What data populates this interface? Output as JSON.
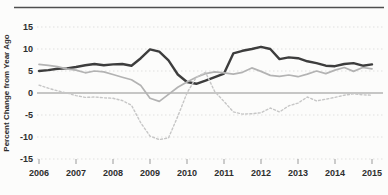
{
  "chart_data": {
    "type": "line",
    "title": "",
    "xlabel": "",
    "ylabel": "Percent Change from Year Ago",
    "x_start": 2006,
    "x_step": 0.25,
    "xlim": [
      2006,
      2015
    ],
    "ylim": [
      -15,
      15
    ],
    "grid": true,
    "legend_position": "none",
    "y_ticks": [
      15,
      10,
      5,
      0,
      -5,
      -10,
      -15
    ],
    "x_ticks": [
      2006,
      2007,
      2008,
      2009,
      2010,
      2011,
      2012,
      2013,
      2014,
      2015
    ],
    "zero_line": true,
    "series": [
      {
        "name": "dark-solid-line",
        "style": "solid",
        "color": "#3d3d3d",
        "width": 2.4,
        "values": [
          5.0,
          5.2,
          5.5,
          5.6,
          5.9,
          6.3,
          6.6,
          6.3,
          6.5,
          6.6,
          6.2,
          7.9,
          9.9,
          9.4,
          7.4,
          4.2,
          2.5,
          2.1,
          2.8,
          3.6,
          4.4,
          9.0,
          9.6,
          10.0,
          10.5,
          10.0,
          7.7,
          8.1,
          7.9,
          7.2,
          6.8,
          6.2,
          6.1,
          6.6,
          6.8,
          6.2,
          6.5
        ]
      },
      {
        "name": "gray-solid-line",
        "style": "solid",
        "color": "#b3b3b3",
        "width": 1.7,
        "values": [
          6.5,
          6.3,
          6.0,
          5.5,
          5.2,
          4.6,
          5.0,
          4.8,
          4.2,
          3.6,
          3.0,
          1.7,
          -1.2,
          -1.9,
          -0.3,
          1.3,
          2.5,
          3.6,
          4.4,
          4.8,
          4.6,
          4.3,
          4.7,
          5.7,
          4.9,
          4.0,
          3.8,
          4.1,
          3.7,
          4.3,
          5.0,
          4.4,
          5.2,
          5.8,
          4.9,
          5.8,
          5.5
        ]
      },
      {
        "name": "light-dotted-line",
        "style": "dotted",
        "color": "#c6c6c6",
        "width": 1.4,
        "values": [
          1.8,
          1.1,
          0.5,
          0.0,
          -0.6,
          -1.0,
          -0.9,
          -1.1,
          -1.2,
          -1.7,
          -2.8,
          -6.8,
          -9.8,
          -10.6,
          -10.2,
          -5.3,
          0.0,
          3.6,
          4.7,
          0.3,
          -1.9,
          -4.3,
          -4.8,
          -4.7,
          -4.5,
          -3.4,
          -4.3,
          -2.9,
          -2.3,
          -0.9,
          -1.8,
          -1.4,
          -1.0,
          -0.5,
          -0.2,
          -0.4,
          -0.5
        ]
      }
    ]
  },
  "colors": {
    "background": "#fcfcfb",
    "top_rule": "#4f4f4f",
    "gridline": "#e0e0df",
    "zero_line": "#8f8f8f",
    "tick_mark": "#9a9a9a",
    "axis_text": "#2e2e2e"
  }
}
